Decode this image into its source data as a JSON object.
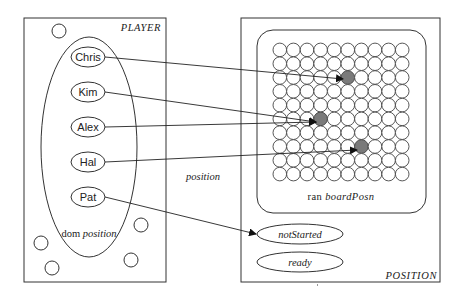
{
  "player_box": {
    "title": "PLAYER",
    "domain_label_prefix": "dom",
    "domain_label_name": "position",
    "players": [
      {
        "name": "Chris",
        "cx": 88,
        "cy": 57,
        "target": [
          347,
          79
        ],
        "arrow_to": "board"
      },
      {
        "name": "Kim",
        "cx": 88,
        "cy": 92,
        "target": [
          320,
          122
        ],
        "arrow_to": "board"
      },
      {
        "name": "Alex",
        "cx": 88,
        "cy": 127,
        "target": [
          320,
          122
        ],
        "arrow_to": "board"
      },
      {
        "name": "Hal",
        "cx": 88,
        "cy": 162,
        "target": [
          361,
          150
        ],
        "arrow_to": "board"
      },
      {
        "name": "Pat",
        "cx": 88,
        "cy": 197,
        "target": [
          256,
          234
        ],
        "arrow_to": "notStarted"
      }
    ],
    "loose_elements": [
      {
        "cx": 59,
        "cy": 31
      },
      {
        "cx": 141,
        "cy": 225
      },
      {
        "cx": 41,
        "cy": 243
      },
      {
        "cx": 52,
        "cy": 268
      },
      {
        "cx": 131,
        "cy": 260
      }
    ]
  },
  "relation_label": "position",
  "position_box": {
    "title": "POSITION",
    "board": {
      "range_label_prefix": "ran",
      "range_label_name": "boardPosn",
      "rows": 10,
      "cols": 10,
      "filled_cells": [
        {
          "col": 5,
          "row": 2
        },
        {
          "col": 3,
          "row": 5
        },
        {
          "col": 6,
          "row": 7
        }
      ]
    },
    "states": [
      {
        "label": "notStarted",
        "cx": 300,
        "cy": 234
      },
      {
        "label": "ready",
        "cx": 300,
        "cy": 262
      }
    ]
  },
  "colors": {
    "stroke": "#333333",
    "filled_cell": "#7a7a7a",
    "background": "#ffffff"
  }
}
